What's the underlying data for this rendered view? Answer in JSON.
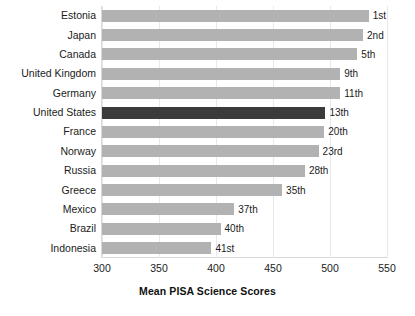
{
  "chart_data": {
    "type": "bar",
    "orientation": "horizontal",
    "title": "",
    "xlabel": "Mean PISA Science Scores",
    "ylabel": "",
    "xlim": [
      300,
      550
    ],
    "xticks": [
      "300",
      "350",
      "400",
      "450",
      "500",
      "550"
    ],
    "grid": true,
    "legend": "none",
    "categories": [
      "Estonia",
      "Japan",
      "Canada",
      "United Kingdom",
      "Germany",
      "United States",
      "France",
      "Norway",
      "Russia",
      "Greece",
      "Mexico",
      "Brazil",
      "Indonesia"
    ],
    "values": [
      534,
      529,
      524,
      509,
      509,
      496,
      495,
      490,
      478,
      458,
      416,
      404,
      396
    ],
    "annotations": [
      "1st",
      "2nd",
      "5th",
      "9th",
      "11th",
      "13th",
      "20th",
      "23rd",
      "28th",
      "35th",
      "37th",
      "40th",
      "41st"
    ],
    "highlight_index": 5,
    "colors": {
      "bar": "#b2b2b2",
      "bar_highlight": "#3b3b3b",
      "text": "#1b1b1b",
      "grid": "#e8e8e8",
      "frame": "#d8d8d8",
      "background": "#ffffff"
    },
    "rows": [
      {
        "country": "Estonia",
        "value": 534,
        "rank": "1st"
      },
      {
        "country": "Japan",
        "value": 529,
        "rank": "2nd"
      },
      {
        "country": "Canada",
        "value": 524,
        "rank": "5th"
      },
      {
        "country": "United Kingdom",
        "value": 509,
        "rank": "9th"
      },
      {
        "country": "Germany",
        "value": 509,
        "rank": "11th"
      },
      {
        "country": "United States",
        "value": 496,
        "rank": "13th"
      },
      {
        "country": "France",
        "value": 495,
        "rank": "20th"
      },
      {
        "country": "Norway",
        "value": 490,
        "rank": "23rd"
      },
      {
        "country": "Russia",
        "value": 478,
        "rank": "28th"
      },
      {
        "country": "Greece",
        "value": 458,
        "rank": "35th"
      },
      {
        "country": "Mexico",
        "value": 416,
        "rank": "37th"
      },
      {
        "country": "Brazil",
        "value": 404,
        "rank": "40th"
      },
      {
        "country": "Indonesia",
        "value": 396,
        "rank": "41st"
      }
    ]
  }
}
